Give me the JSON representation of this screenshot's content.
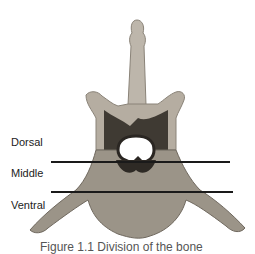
{
  "figure": {
    "labels": [
      {
        "text": "Dorsal",
        "x": 11,
        "y": 137
      },
      {
        "text": "Middle",
        "x": 11,
        "y": 168
      },
      {
        "text": "Ventral",
        "x": 11,
        "y": 200
      }
    ],
    "divider_lines": [
      {
        "x1": 51,
        "x2": 230,
        "y": 162
      },
      {
        "x1": 51,
        "x2": 233,
        "y": 192
      }
    ],
    "caption": "Figure 1.1 Division of the bone",
    "colors": {
      "bone_light": "#c9c3b8",
      "bone_mid": "#9e978c",
      "bone_dark": "#3b3630",
      "line": "#1a1a1a"
    }
  }
}
